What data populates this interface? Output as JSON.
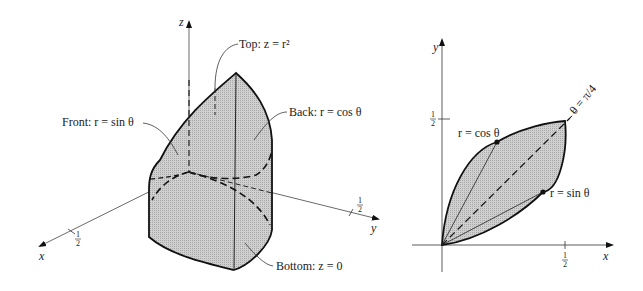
{
  "figure_left": {
    "axes": {
      "x": "x",
      "y": "y",
      "z": "z"
    },
    "ticks": {
      "x_half": "1",
      "x_half_den": "2",
      "y_half": "1",
      "y_half_den": "2"
    },
    "labels": {
      "top": "Top: z = r²",
      "front": "Front: r = sin θ",
      "back": "Back: r = cos θ",
      "bottom": "Bottom: z = 0"
    }
  },
  "figure_right": {
    "axes": {
      "x": "x",
      "y": "y"
    },
    "ticks": {
      "x_half": "1",
      "x_half_den": "2",
      "y_half": "1",
      "y_half_den": "2"
    },
    "labels": {
      "cos_curve": "r = cos θ",
      "sin_curve": "r = sin θ",
      "diagonal": "θ = π/4"
    }
  },
  "colors": {
    "fill": "#c8c8c8",
    "stroke": "#222222",
    "background": "#ffffff"
  }
}
